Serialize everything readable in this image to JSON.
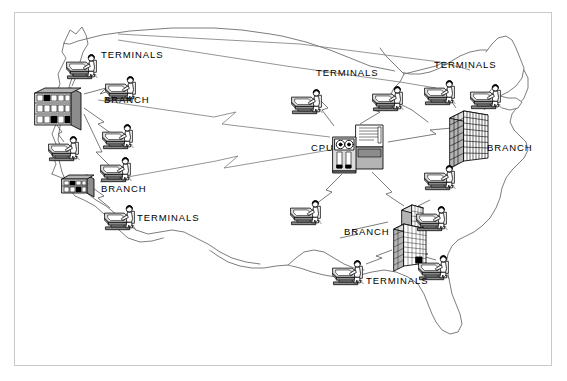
{
  "figure": {
    "background_color": "#ffffff",
    "frame_color": "#c9c9c9",
    "ink_color": "#000000",
    "map_outline_color": "#6e6e6e",
    "link_color": "#7a7a7a",
    "width": 567,
    "height": 381
  },
  "labels": [
    {
      "id": "terminals-nw",
      "text": "TERMINALS",
      "x": 101,
      "y": 58
    },
    {
      "id": "branch-nw",
      "text": "BRANCH",
      "x": 104,
      "y": 103
    },
    {
      "id": "branch-w",
      "text": "BRANCH",
      "x": 101,
      "y": 192
    },
    {
      "id": "terminals-w",
      "text": "TERMINALS",
      "x": 137,
      "y": 221
    },
    {
      "id": "terminals-center",
      "text": "TERMINALS",
      "x": 316,
      "y": 76
    },
    {
      "id": "cpu",
      "text": "CPU",
      "x": 313,
      "y": 151
    },
    {
      "id": "terminals-ne",
      "text": "TERMINALS",
      "x": 434,
      "y": 68
    },
    {
      "id": "branch-ne",
      "text": "BRANCH",
      "x": 487,
      "y": 151
    },
    {
      "id": "branch-se",
      "text": "BRANCH",
      "x": 345,
      "y": 235
    },
    {
      "id": "terminals-se",
      "text": "TERMINALS",
      "x": 366,
      "y": 284
    }
  ],
  "nodes": {
    "cpu": {
      "name": "CPU",
      "type": "mainframe",
      "icon": "mainframe-icon",
      "x": 333,
      "y": 124,
      "width": 55,
      "height": 50
    },
    "branches": [
      {
        "id": "branch-west",
        "name": "BRANCH",
        "type": "office-building",
        "icon": "office-building-icon",
        "x": 35,
        "y": 84,
        "style": "lowrise"
      },
      {
        "id": "branch-southwest",
        "name": "BRANCH",
        "type": "office-building",
        "icon": "office-building-icon",
        "x": 60,
        "y": 170,
        "style": "lowrise-small"
      },
      {
        "id": "branch-northeast",
        "name": "BRANCH",
        "type": "office-tower",
        "icon": "office-tower-icon",
        "x": 450,
        "y": 108,
        "style": "tower"
      },
      {
        "id": "branch-southeast",
        "name": "BRANCH",
        "type": "office-tower",
        "icon": "office-tower-icon",
        "x": 393,
        "y": 205,
        "style": "tower-tall"
      }
    ],
    "terminals": [
      {
        "id": "terminal-1",
        "name": "TERMINALS",
        "icon": "terminal-operator-icon",
        "x": 74,
        "y": 53
      },
      {
        "id": "terminal-2",
        "name": "TERMINALS",
        "icon": "terminal-operator-icon",
        "x": 110,
        "y": 73
      },
      {
        "id": "terminal-3",
        "name": "TERMINALS",
        "icon": "terminal-operator-icon",
        "x": 52,
        "y": 133
      },
      {
        "id": "terminal-4",
        "name": "TERMINALS",
        "icon": "terminal-operator-icon",
        "x": 104,
        "y": 124
      },
      {
        "id": "terminal-5",
        "name": "TERMINALS",
        "icon": "terminal-operator-icon",
        "x": 105,
        "y": 155
      },
      {
        "id": "terminal-6",
        "name": "TERMINALS",
        "icon": "terminal-operator-icon",
        "x": 105,
        "y": 206
      },
      {
        "id": "terminal-7",
        "name": "TERMINALS",
        "icon": "terminal-operator-icon",
        "x": 297,
        "y": 88
      },
      {
        "id": "terminal-8",
        "name": "TERMINALS",
        "icon": "terminal-operator-icon",
        "x": 377,
        "y": 86
      },
      {
        "id": "terminal-9",
        "name": "TERMINALS",
        "icon": "terminal-operator-icon",
        "x": 428,
        "y": 80
      },
      {
        "id": "terminal-10",
        "name": "TERMINALS",
        "icon": "terminal-operator-icon",
        "x": 473,
        "y": 85
      },
      {
        "id": "terminal-11",
        "name": "TERMINALS",
        "icon": "terminal-operator-icon",
        "x": 430,
        "y": 164
      },
      {
        "id": "terminal-12",
        "name": "TERMINALS",
        "icon": "terminal-operator-icon",
        "x": 296,
        "y": 200
      },
      {
        "id": "terminal-13",
        "name": "TERMINALS",
        "icon": "terminal-operator-icon",
        "x": 420,
        "y": 205
      },
      {
        "id": "terminal-14",
        "name": "TERMINALS",
        "icon": "terminal-operator-icon",
        "x": 338,
        "y": 260
      },
      {
        "id": "terminal-15",
        "name": "TERMINALS",
        "icon": "terminal-operator-icon",
        "x": 423,
        "y": 255
      }
    ]
  },
  "links": {
    "description": "Zigzag communication lines from CPU to remote branches and direct lines to local terminals",
    "longhaul_count": 3,
    "local_count": 12
  },
  "map": {
    "region": "Contiguous United States",
    "outline_style": "single thin gray contour"
  }
}
